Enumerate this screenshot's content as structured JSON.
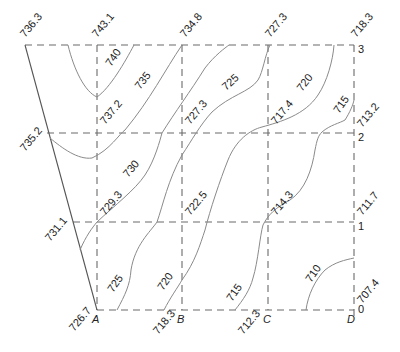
{
  "diagram": {
    "type": "contour-grid-site-plan",
    "columns": [
      "A",
      "B",
      "C",
      "D"
    ],
    "rows": [
      "0",
      "1",
      "2",
      "3"
    ],
    "boundary_corner_elevations": {
      "top_left_outer": "736.3",
      "mid_left_outer": "735.2",
      "lower_left_outer": "731.1"
    },
    "grid_elevations": {
      "A3": "743.1",
      "B3": "734.8",
      "C3": "727.3",
      "D3": "718.3",
      "A2": "737.2",
      "B2": "727.3",
      "C2": "717.4",
      "D2": "713.2",
      "A1": "729.3",
      "B1": "722.5",
      "C1": "714.3",
      "D1": "711.7",
      "A0": "726.7",
      "B0": "718.3",
      "C0": "712.3",
      "D0": "707.4"
    },
    "contour_labels": {
      "c740": "740",
      "c735": "735",
      "c730": "730",
      "c725_upper": "725",
      "c725_lower": "725",
      "c720_upper": "720",
      "c720_lower": "720",
      "c715_upper": "715",
      "c715_lower": "715",
      "c710": "710"
    }
  }
}
